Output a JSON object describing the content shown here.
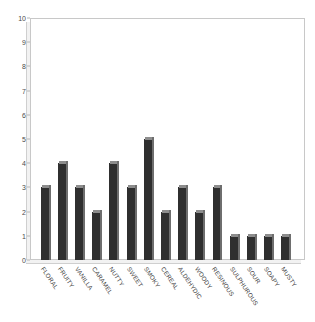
{
  "chart_data": {
    "type": "bar",
    "title": "",
    "subtitle": "",
    "xlabel": "",
    "ylabel": "",
    "ylim": [
      0,
      10
    ],
    "grid": false,
    "legend": false,
    "legend_position": "none",
    "y_ticks": [
      "0",
      "1",
      "2",
      "3",
      "4",
      "5",
      "6",
      "7",
      "8",
      "9",
      "10"
    ],
    "categories": [
      "FLORAL",
      "FRUITY",
      "VANILLA",
      "CARAMEL",
      "NUTTY",
      "SWEET",
      "SMOKY",
      "CEREAL",
      "ALDEHYDIC",
      "WOODY",
      "RESINOUS",
      "SULPHUROUS",
      "SOUR",
      "SOAPY",
      "MUSTY"
    ],
    "values": [
      3,
      4,
      3,
      2,
      4,
      3,
      5,
      2,
      3,
      2,
      3,
      1,
      1,
      1,
      1
    ],
    "bar_color": "#2f2f2f",
    "bar_top_color": "#8d8d8d",
    "bar_side_color": "#6e6e6e",
    "frame_color": "#c8c8c8",
    "plot_background": "#ffffff",
    "tick_label_color": "#3b3b3b"
  }
}
